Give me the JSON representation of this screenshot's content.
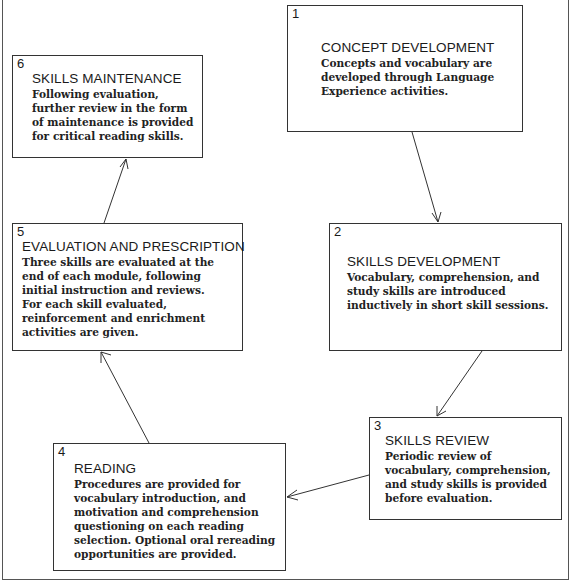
{
  "diagram": {
    "type": "cycle-flowchart",
    "boxes": [
      {
        "number": "1",
        "title": "CONCEPT  DEVELOPMENT",
        "description": "Concepts and vocabulary are\ndeveloped through Language\nExperience activities."
      },
      {
        "number": "2",
        "title": "SKILLS  DEVELOPMENT",
        "description": "Vocabulary, comprehension, and\nstudy skills are introduced\ninductively in short skill sessions."
      },
      {
        "number": "3",
        "title": "SKILLS  REVIEW",
        "description": "Periodic review of\nvocabulary, comprehension,\nand study skills is provided\nbefore evaluation."
      },
      {
        "number": "4",
        "title": "READING",
        "description": "Procedures are provided for\nvocabulary introduction, and\nmotivation and comprehension\nquestioning on each reading\nselection. Optional oral rereading\nopportunities are provided."
      },
      {
        "number": "5",
        "title": "EVALUATION AND PRESCRIPTION",
        "description": "Three skills are evaluated at the\nend of each module, following\ninitial instruction and reviews.\nFor each skill evaluated,\nreinforcement and enrichment\nactivities are given."
      },
      {
        "number": "6",
        "title": "SKILLS  MAINTENANCE",
        "description": "Following evaluation,\nfurther review in the form\nof maintenance is provided\nfor critical reading skills."
      }
    ],
    "edges": [
      {
        "from": "1",
        "to": "2"
      },
      {
        "from": "2",
        "to": "3"
      },
      {
        "from": "3",
        "to": "4"
      },
      {
        "from": "4",
        "to": "5"
      },
      {
        "from": "5",
        "to": "6"
      }
    ]
  }
}
